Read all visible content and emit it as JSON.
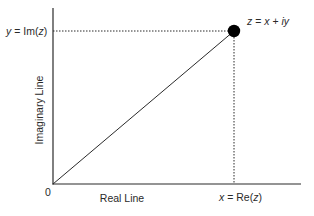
{
  "diagram": {
    "type": "complex-plane",
    "axes": {
      "x_label": "Real Line",
      "y_label": "Imaginary Line",
      "origin_label": "0"
    },
    "point": {
      "label_parts": [
        "z",
        " = ",
        "x",
        " + ",
        "iy"
      ],
      "label": "z = x + iy"
    },
    "projections": {
      "x_label_parts": [
        "x",
        " = Re(",
        "z",
        ")"
      ],
      "x_label": "x = Re(z)",
      "y_label_parts": [
        "y",
        " = Im(",
        "z",
        ")"
      ],
      "y_label": "y = Im(z)"
    },
    "colors": {
      "line": "#2a2a2a",
      "point": "#000000",
      "background": "#ffffff"
    }
  }
}
